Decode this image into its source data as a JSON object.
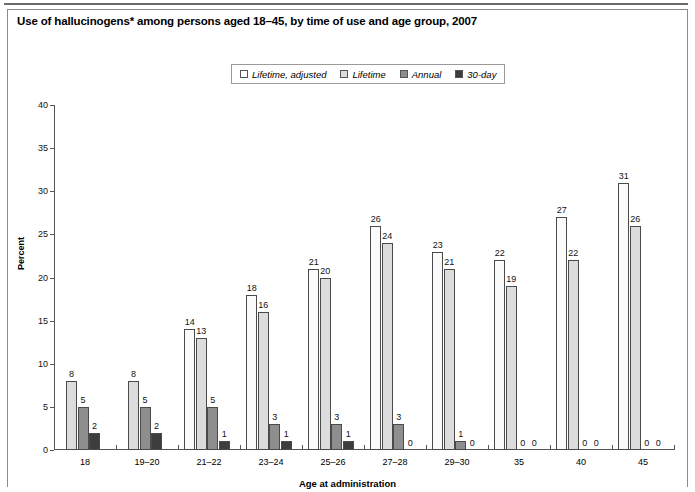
{
  "chart_data": {
    "type": "bar",
    "title": "Use of hallucinogens* among persons aged 18–45, by time of use and age group, 2007",
    "xlabel": "Age at administration",
    "ylabel": "Percent",
    "ylim": [
      0,
      40
    ],
    "yticks": [
      0,
      5,
      10,
      15,
      20,
      25,
      30,
      35,
      40
    ],
    "grid": false,
    "legend_position": "top-center",
    "categories": [
      "18",
      "19–20",
      "21–22",
      "23–24",
      "25–26",
      "27–28",
      "29–30",
      "35",
      "40",
      "45"
    ],
    "series": [
      {
        "name": "Lifetime, adjusted",
        "color": "#fbfbfb",
        "values": [
          null,
          null,
          14,
          18,
          21,
          26,
          23,
          22,
          27,
          31
        ]
      },
      {
        "name": "Lifetime",
        "color": "#dcdcdc",
        "values": [
          8,
          8,
          13,
          16,
          20,
          24,
          21,
          19,
          22,
          26
        ]
      },
      {
        "name": "Annual",
        "color": "#8e8e8e",
        "values": [
          5,
          5,
          5,
          3,
          3,
          3,
          1,
          0,
          0,
          0
        ]
      },
      {
        "name": "30-day",
        "color": "#3d3d3d",
        "values": [
          2,
          2,
          1,
          1,
          1,
          0,
          0,
          0,
          0,
          0
        ]
      }
    ]
  },
  "legend": {
    "items": [
      {
        "label": "Lifetime, adjusted",
        "swatch": "#ffffff"
      },
      {
        "label": "Lifetime",
        "swatch": "#dcdcdc"
      },
      {
        "label": "Annual",
        "swatch": "#8e8e8e"
      },
      {
        "label": "30-day",
        "swatch": "#3d3d3d"
      }
    ]
  }
}
